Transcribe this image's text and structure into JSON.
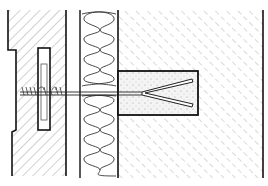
{
  "diagram": {
    "colors": {
      "line": "#111111",
      "hatch": "#9a9a9a",
      "insulation": "#333333",
      "plug_fill": "#f4f4f4",
      "plug_dots": "#888888",
      "background": "#ffffff"
    },
    "components": [
      {
        "id": "outer-leaf",
        "label": "Outer masonry leaf"
      },
      {
        "id": "insulation",
        "label": "Insulation layer"
      },
      {
        "id": "inner-wall",
        "label": "Inner concrete wall"
      },
      {
        "id": "anchor-plug",
        "label": "Anchor plug"
      },
      {
        "id": "tie-rod",
        "label": "Wall tie rod"
      }
    ]
  }
}
